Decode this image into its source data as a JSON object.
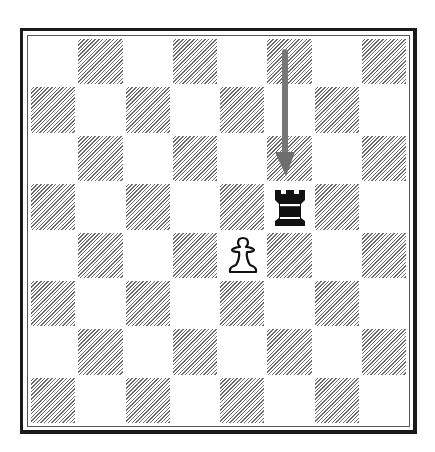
{
  "diagram": {
    "type": "chess-position",
    "orientation": "white-bottom",
    "files": [
      "a",
      "b",
      "c",
      "d",
      "e",
      "f",
      "g",
      "h"
    ],
    "ranks": [
      8,
      7,
      6,
      5,
      4,
      3,
      2,
      1
    ],
    "pieces": [
      {
        "square": "f5",
        "color": "black",
        "type": "rook",
        "icon": "black-rook-icon"
      },
      {
        "square": "e4",
        "color": "white",
        "type": "pawn",
        "icon": "white-pawn-icon"
      }
    ],
    "arrows": [
      {
        "from": "f8",
        "to": "f6",
        "color": "#777777",
        "meaning": "rook arrived from f-file above"
      }
    ],
    "colors": {
      "hatch": "#6b6b6b",
      "light_square": "#ffffff",
      "frame": "#1a1a1a",
      "arrow": "#777777"
    }
  }
}
